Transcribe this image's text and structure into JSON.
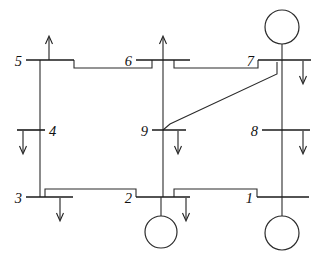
{
  "diagram": {
    "type": "one-line-diagram",
    "stroke_color": "#2b2b2b",
    "background_color": "#ffffff",
    "buses": [
      {
        "id": "1",
        "label": "1",
        "label_x": 253,
        "label_y": 203,
        "bar_x1": 257,
        "bar_x2": 309,
        "bar_y": 197,
        "has_generator": true,
        "generator_side": "below",
        "gen_cx": 282,
        "gen_cy": 233,
        "gen_r": 17,
        "gen_lead_y1": 197,
        "gen_lead_y2": 216
      },
      {
        "id": "2",
        "label": "2",
        "label_x": 130,
        "label_y": 203,
        "bar_x1": 136,
        "bar_x2": 190,
        "bar_y": 197,
        "has_generator": true,
        "generator_side": "below",
        "gen_cx": 161,
        "gen_cy": 232,
        "gen_r": 16,
        "gen_lead_y1": 197,
        "gen_lead_y2": 216
      },
      {
        "id": "3",
        "label": "3",
        "label_x": 14,
        "label_y": 203,
        "bar_x1": 26,
        "bar_x2": 73,
        "bar_y": 197,
        "has_generator": false
      },
      {
        "id": "4",
        "label": "4",
        "label_x": 49,
        "label_y": 136,
        "bar_x1": 17,
        "bar_x2": 45,
        "bar_y": 130,
        "has_generator": false
      },
      {
        "id": "5",
        "label": "5",
        "label_x": 14,
        "label_y": 66,
        "bar_x1": 26,
        "bar_x2": 74,
        "bar_y": 60,
        "has_generator": false
      },
      {
        "id": "6",
        "label": "6",
        "label_x": 128,
        "label_y": 66,
        "bar_x1": 136,
        "bar_x2": 190,
        "bar_y": 60,
        "has_generator": false
      },
      {
        "id": "7",
        "label": "7",
        "label_x": 252,
        "label_y": 66,
        "bar_x1": 258,
        "bar_x2": 311,
        "bar_y": 60,
        "has_generator": true,
        "generator_side": "above",
        "gen_cx": 282,
        "gen_cy": 27,
        "gen_r": 17,
        "gen_lead_y1": 44,
        "gen_lead_y2": 60
      },
      {
        "id": "8",
        "label": "8",
        "label_x": 251,
        "label_y": 136,
        "bar_x1": 262,
        "bar_x2": 310,
        "bar_y": 130,
        "has_generator": false
      },
      {
        "id": "9",
        "label": "9",
        "label_x": 143,
        "label_y": 136,
        "bar_x1": 152,
        "bar_x2": 186,
        "bar_y": 130,
        "has_generator": false
      }
    ],
    "injections": [
      {
        "bus": "5",
        "direction": "up",
        "x": 49,
        "y_tail": 60,
        "y_head": 36
      },
      {
        "bus": "6",
        "direction": "up",
        "x": 163,
        "y_tail": 60,
        "y_head": 36
      },
      {
        "bus": "7",
        "direction": "down",
        "x": 303,
        "y_tail": 62,
        "y_head": 84
      },
      {
        "bus": "8",
        "direction": "down",
        "x": 303,
        "y_tail": 132,
        "y_head": 154
      },
      {
        "bus": "9",
        "direction": "down",
        "x": 178,
        "y_tail": 132,
        "y_head": 154
      },
      {
        "bus": "4",
        "direction": "down",
        "x": 23,
        "y_tail": 132,
        "y_head": 154
      },
      {
        "bus": "3",
        "direction": "down",
        "x": 60,
        "y_tail": 199,
        "y_head": 221
      },
      {
        "bus": "2",
        "direction": "down",
        "x": 186,
        "y_tail": 199,
        "y_head": 221
      }
    ],
    "lines": [
      {
        "from": "5",
        "to": "6",
        "kind": "stepped-horizontal"
      },
      {
        "from": "6",
        "to": "7",
        "kind": "stepped-horizontal"
      },
      {
        "from": "3",
        "to": "2",
        "kind": "stepped-horizontal"
      },
      {
        "from": "2",
        "to": "1",
        "kind": "stepped-horizontal"
      },
      {
        "from": "5",
        "to": "3",
        "kind": "vertical-left"
      },
      {
        "from": "7",
        "to": "1",
        "kind": "vertical-right"
      },
      {
        "from": "6",
        "to": "2",
        "kind": "vertical-center"
      },
      {
        "from": "9",
        "to": "7",
        "kind": "diagonal"
      }
    ]
  }
}
